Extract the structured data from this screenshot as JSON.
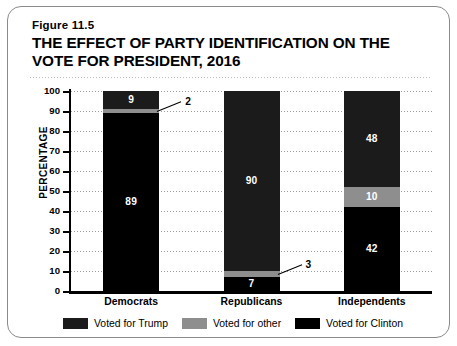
{
  "figure": {
    "number": "Figure 11.5",
    "title": "THE EFFECT OF PARTY IDENTIFICATION ON THE VOTE FOR PRESIDENT, 2016"
  },
  "chart_data": {
    "type": "bar",
    "subtype": "stacked-bar-100-percent",
    "title": "THE EFFECT OF PARTY IDENTIFICATION ON THE VOTE FOR PRESIDENT, 2016",
    "xlabel": "",
    "ylabel": "PERCENTAGE",
    "ylim": [
      0,
      100
    ],
    "yticks": [
      0,
      10,
      20,
      30,
      40,
      50,
      60,
      70,
      80,
      90,
      100
    ],
    "ytick_labels": [
      "0",
      "10",
      "20",
      "30",
      "40",
      "50",
      "60",
      "70",
      "80",
      "90",
      "100"
    ],
    "grid": true,
    "legend_position": "bottom",
    "categories": [
      "Democrats",
      "Republicans",
      "Independents"
    ],
    "series": [
      {
        "name": "Voted for Trump",
        "color": "#1b1b1b",
        "values": [
          9,
          90,
          48
        ]
      },
      {
        "name": "Voted for other",
        "color": "#8e8e8e",
        "values": [
          2,
          3,
          10
        ]
      },
      {
        "name": "Voted for Clinton",
        "color": "#000000",
        "values": [
          89,
          7,
          42
        ]
      }
    ],
    "annotations": [
      {
        "text": "2",
        "category": "Democrats",
        "series": "Voted for other",
        "value": 2,
        "style": "leader-line"
      },
      {
        "text": "3",
        "category": "Republicans",
        "series": "Voted for other",
        "value": 3,
        "style": "leader-line"
      }
    ]
  },
  "yticks": [
    {
      "label": "100",
      "value": 100
    },
    {
      "label": "90",
      "value": 90
    },
    {
      "label": "80",
      "value": 80
    },
    {
      "label": "70",
      "value": 70
    },
    {
      "label": "60",
      "value": 60
    },
    {
      "label": "50",
      "value": 50
    },
    {
      "label": "40",
      "value": 40
    },
    {
      "label": "30",
      "value": 30
    },
    {
      "label": "20",
      "value": 20
    },
    {
      "label": "10",
      "value": 10
    },
    {
      "label": "0",
      "value": 0
    }
  ],
  "axis": {
    "y_title": "PERCENTAGE"
  },
  "bars": [
    {
      "category": "Democrats",
      "segments": [
        {
          "series": "Voted for Trump",
          "value": 9,
          "label": "9",
          "label_inside": true
        },
        {
          "series": "Voted for other",
          "value": 2,
          "label": "2",
          "label_inside": false
        },
        {
          "series": "Voted for Clinton",
          "value": 89,
          "label": "89",
          "label_inside": true
        }
      ]
    },
    {
      "category": "Republicans",
      "segments": [
        {
          "series": "Voted for Trump",
          "value": 90,
          "label": "90",
          "label_inside": true
        },
        {
          "series": "Voted for other",
          "value": 3,
          "label": "3",
          "label_inside": false
        },
        {
          "series": "Voted for Clinton",
          "value": 7,
          "label": "7",
          "label_inside": true
        }
      ]
    },
    {
      "category": "Independents",
      "segments": [
        {
          "series": "Voted for Trump",
          "value": 48,
          "label": "48",
          "label_inside": true
        },
        {
          "series": "Voted for other",
          "value": 10,
          "label": "10",
          "label_inside": true
        },
        {
          "series": "Voted for Clinton",
          "value": 42,
          "label": "42",
          "label_inside": true
        }
      ]
    }
  ],
  "callouts": [
    {
      "name": "democrats-other-callout",
      "text": "2"
    },
    {
      "name": "republicans-other-callout",
      "text": "3"
    }
  ],
  "legend": {
    "items": [
      {
        "label": "Voted for Trump",
        "color": "#1b1b1b"
      },
      {
        "label": "Voted for other",
        "color": "#8e8e8e"
      },
      {
        "label": "Voted for Clinton",
        "color": "#000000"
      }
    ]
  }
}
